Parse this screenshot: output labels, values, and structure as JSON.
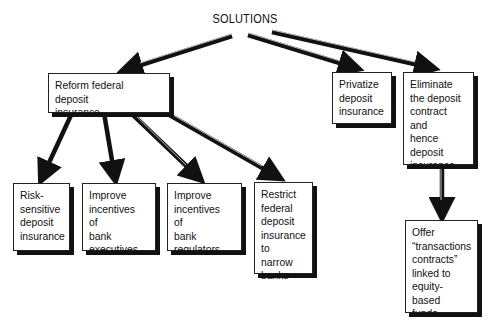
{
  "diagram": {
    "title": "SOLUTIONS",
    "nodes": {
      "reform": {
        "label": "Reform federal deposit\ninsurance"
      },
      "privatize": {
        "label": "Privatize\ndeposit\ninsurance"
      },
      "eliminate": {
        "label": "Eliminate\nthe deposit\ncontract and\nhence\ndeposit\ninsurance"
      },
      "risk": {
        "label": "Risk-\nsensitive\ndeposit\ninsurance"
      },
      "executives": {
        "label": "Improve\nincentives of\nbank\nexecutives"
      },
      "regulators": {
        "label": "Improve\nincentives of\nbank\nregulators"
      },
      "restrict": {
        "label": "Restrict\nfederal\ndeposit\ninsurance\nto narrow\nbanks"
      },
      "offer": {
        "label": "Offer\n“transactions\ncontracts”\nlinked to\nequity-based\nfunds"
      }
    },
    "edges": [
      {
        "from": "SOLUTIONS",
        "to": "reform"
      },
      {
        "from": "SOLUTIONS",
        "to": "privatize"
      },
      {
        "from": "SOLUTIONS",
        "to": "eliminate"
      },
      {
        "from": "reform",
        "to": "risk"
      },
      {
        "from": "reform",
        "to": "executives"
      },
      {
        "from": "reform",
        "to": "regulators"
      },
      {
        "from": "reform",
        "to": "restrict"
      },
      {
        "from": "eliminate",
        "to": "offer"
      }
    ]
  }
}
